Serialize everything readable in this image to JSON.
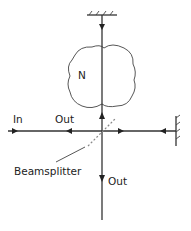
{
  "diagram": {
    "type": "optical-interferometer",
    "labels": {
      "sample": "N",
      "input": "In",
      "output_left": "Out",
      "output_bottom": "Out",
      "beamsplitter": "Beamsplitter"
    },
    "components": [
      {
        "id": "top-mirror",
        "kind": "mirror",
        "orientation": "horizontal"
      },
      {
        "id": "right-mirror",
        "kind": "mirror",
        "orientation": "vertical"
      },
      {
        "id": "beamsplitter",
        "kind": "beamsplitter",
        "style": "dashed-diagonal"
      },
      {
        "id": "sample-N",
        "kind": "medium-blob"
      }
    ],
    "colors": {
      "line": "#333333",
      "text": "#222222",
      "beamsplitter": "#888888",
      "background": "#ffffff"
    }
  }
}
